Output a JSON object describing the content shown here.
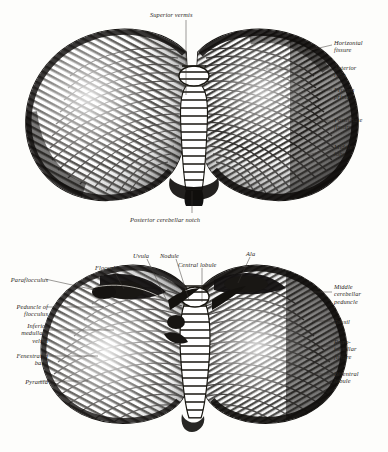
{
  "plate": {
    "title_visible": false,
    "style": "engraving",
    "ink_color": "#171512",
    "paper_color": "#fdfdfb",
    "leader_color": "#3a3732"
  },
  "figures": [
    {
      "id": "superior-view",
      "view": "superior surface of the cerebellum",
      "labels": [
        {
          "id": "superior-vermis",
          "text": "Superior vermis",
          "side": "top",
          "x": 150,
          "y": 11,
          "leader": [
            [
              186,
              20
            ],
            [
              186,
              95
            ]
          ]
        },
        {
          "id": "horizontal-fissure",
          "text": "Horizontal\nfissure",
          "side": "right",
          "x": 334,
          "y": 39,
          "leader": [
            [
              332,
              45
            ],
            [
              306,
              51
            ]
          ]
        },
        {
          "id": "anterior-lobe",
          "text": "Anterior\nlobe",
          "side": "right",
          "x": 334,
          "y": 64,
          "leader": [
            [
              332,
              69
            ],
            [
              266,
              69
            ]
          ]
        },
        {
          "id": "fissura-prima",
          "text": "Fissura\nprima",
          "side": "right",
          "x": 334,
          "y": 86,
          "leader": [
            [
              332,
              90
            ],
            [
              311,
              90
            ]
          ]
        },
        {
          "id": "postlunate-fissure",
          "text": "Postlunate\nfissure",
          "side": "right",
          "x": 334,
          "y": 116,
          "leader": [
            [
              332,
              121
            ],
            [
              303,
              121
            ]
          ]
        },
        {
          "id": "middle-lobe",
          "text": "Middle\nlobe",
          "side": "right",
          "x": 334,
          "y": 143,
          "leader": [
            [
              332,
              148
            ],
            [
              308,
              155
            ]
          ]
        },
        {
          "id": "posterior-cerebellar-notch",
          "text": "Posterior cerebellar notch",
          "side": "bottom",
          "x": 130,
          "y": 216,
          "leader": [
            [
              192,
              213
            ],
            [
              192,
              191
            ]
          ]
        }
      ]
    },
    {
      "id": "inferior-view",
      "view": "inferior surface of the cerebellum",
      "labels": [
        {
          "id": "paraflocculus",
          "text": "Paraflocculus",
          "side": "left",
          "x": 4,
          "y": 276,
          "leader": [
            [
              45,
              279
            ],
            [
              95,
              290
            ]
          ]
        },
        {
          "id": "flocculus",
          "text": "Flocculus",
          "side": "top",
          "x": 95,
          "y": 264,
          "leader": [
            [
              114,
              271
            ],
            [
              124,
              289
            ]
          ]
        },
        {
          "id": "uvula",
          "text": "Uvula",
          "side": "top",
          "x": 133,
          "y": 252,
          "leader": [
            [
              147,
              259
            ],
            [
              166,
              299
            ]
          ]
        },
        {
          "id": "nodule",
          "text": "Nodule",
          "side": "top",
          "x": 160,
          "y": 252,
          "leader": [
            [
              176,
              259
            ],
            [
              189,
              300
            ]
          ]
        },
        {
          "id": "central-lobule",
          "text": "Central lobule",
          "side": "top",
          "x": 178,
          "y": 261,
          "leader": [
            [
              202,
              268
            ],
            [
              202,
              302
            ]
          ]
        },
        {
          "id": "ala",
          "text": "Ala",
          "side": "top",
          "x": 246,
          "y": 250,
          "leader": [
            [
              250,
              257
            ],
            [
              238,
              283
            ]
          ]
        },
        {
          "id": "peduncle-of-flocculus",
          "text": "Peduncle of\nflocculus",
          "side": "left",
          "x": 4,
          "y": 303,
          "leader": [
            [
              47,
              307
            ],
            [
              104,
              307
            ]
          ]
        },
        {
          "id": "inferior-medullary-velum",
          "text": "Inferior\nmedullary\nvelum",
          "side": "left",
          "x": 4,
          "y": 322,
          "leader": [
            [
              47,
              330
            ],
            [
              114,
              330
            ]
          ]
        },
        {
          "id": "fenestrated-band",
          "text": "Fenestrated\nband",
          "side": "left",
          "x": 4,
          "y": 352,
          "leader": [
            [
              47,
              356
            ],
            [
              98,
              356
            ]
          ]
        },
        {
          "id": "pyramid",
          "text": "Pyramid",
          "side": "left",
          "x": 4,
          "y": 378,
          "leader": [
            [
              40,
              381
            ],
            [
              88,
              381
            ]
          ]
        },
        {
          "id": "middle-cerebellar-peduncle",
          "text": "Middle\ncerebellar\npeduncle",
          "side": "right",
          "x": 334,
          "y": 283,
          "leader": [
            [
              332,
              292
            ],
            [
              305,
              292
            ]
          ]
        },
        {
          "id": "tonsil",
          "text": "Tonsil",
          "side": "right",
          "x": 334,
          "y": 318,
          "leader": [
            [
              332,
              321
            ],
            [
              312,
              321
            ]
          ]
        },
        {
          "id": "retrotonsillar-fissure",
          "text": "Retro-\ntonsillar\nfissure",
          "side": "right",
          "x": 334,
          "y": 338,
          "leader": [
            [
              332,
              346
            ],
            [
              315,
              346
            ]
          ]
        },
        {
          "id": "biventral-lobule",
          "text": "Biventral\nlobule",
          "side": "right",
          "x": 334,
          "y": 370,
          "leader": [
            [
              332,
              374
            ],
            [
              310,
              374
            ]
          ]
        }
      ]
    }
  ]
}
